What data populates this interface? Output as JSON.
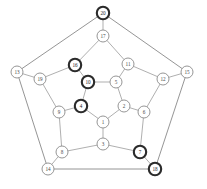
{
  "figure": {
    "type": "graph-diagram",
    "name": "dodecahedral-graph",
    "background_color": "#ffffff",
    "edge_color": "#8d8d8d",
    "node_fill": "#ffffff",
    "node_stroke": "#8a8a8a",
    "highlight_stroke": "#2b2b2b",
    "label_color": "#4a4a4a"
  },
  "chart_data": {
    "type": "graph",
    "title": "",
    "node_count": 20,
    "edge_count": 30,
    "nodes": [
      {
        "id": "1",
        "label": "1",
        "x": 103,
        "y": 122,
        "r": 6.0,
        "highlighted": false
      },
      {
        "id": "2",
        "label": "2",
        "x": 124,
        "y": 106,
        "r": 6.0,
        "highlighted": false
      },
      {
        "id": "3",
        "label": "3",
        "x": 103,
        "y": 144,
        "r": 6.0,
        "highlighted": false
      },
      {
        "id": "4",
        "label": "4",
        "x": 81,
        "y": 106,
        "r": 6.2,
        "highlighted": true
      },
      {
        "id": "5",
        "label": "5",
        "x": 116,
        "y": 82,
        "r": 6.0,
        "highlighted": false
      },
      {
        "id": "6",
        "label": "6",
        "x": 144,
        "y": 112,
        "r": 6.0,
        "highlighted": false
      },
      {
        "id": "7",
        "label": "7",
        "x": 140,
        "y": 152,
        "r": 6.2,
        "highlighted": true
      },
      {
        "id": "8",
        "label": "8",
        "x": 62,
        "y": 152,
        "r": 6.0,
        "highlighted": false
      },
      {
        "id": "9",
        "label": "9",
        "x": 59,
        "y": 112,
        "r": 6.0,
        "highlighted": false
      },
      {
        "id": "10",
        "label": "10",
        "x": 88,
        "y": 82,
        "r": 6.2,
        "highlighted": true
      },
      {
        "id": "11",
        "label": "11",
        "x": 128,
        "y": 64,
        "r": 6.0,
        "highlighted": false
      },
      {
        "id": "12",
        "label": "12",
        "x": 163,
        "y": 79,
        "r": 6.0,
        "highlighted": false
      },
      {
        "id": "13",
        "label": "13",
        "x": 17,
        "y": 72,
        "r": 6.0,
        "highlighted": false
      },
      {
        "id": "14",
        "label": "14",
        "x": 48,
        "y": 169,
        "r": 6.0,
        "highlighted": false
      },
      {
        "id": "15",
        "label": "15",
        "x": 187,
        "y": 72,
        "r": 6.0,
        "highlighted": false
      },
      {
        "id": "16",
        "label": "16",
        "x": 75,
        "y": 65,
        "r": 6.2,
        "highlighted": true
      },
      {
        "id": "17",
        "label": "17",
        "x": 103,
        "y": 36,
        "r": 6.0,
        "highlighted": false
      },
      {
        "id": "18",
        "label": "18",
        "x": 155,
        "y": 169,
        "r": 6.2,
        "highlighted": true
      },
      {
        "id": "19",
        "label": "19",
        "x": 40,
        "y": 79,
        "r": 6.0,
        "highlighted": false
      },
      {
        "id": "20",
        "label": "20",
        "x": 103,
        "y": 13,
        "r": 6.2,
        "highlighted": true
      }
    ],
    "edges": [
      {
        "source": "1",
        "target": "2",
        "ring": "inner"
      },
      {
        "source": "1",
        "target": "4",
        "ring": "inner"
      },
      {
        "source": "1",
        "target": "3",
        "ring": "spoke"
      },
      {
        "source": "2",
        "target": "5",
        "ring": "inner"
      },
      {
        "source": "2",
        "target": "6",
        "ring": "spoke"
      },
      {
        "source": "4",
        "target": "10",
        "ring": "inner"
      },
      {
        "source": "4",
        "target": "9",
        "ring": "spoke"
      },
      {
        "source": "5",
        "target": "10",
        "ring": "inner"
      },
      {
        "source": "5",
        "target": "11",
        "ring": "spoke"
      },
      {
        "source": "10",
        "target": "16",
        "ring": "spoke"
      },
      {
        "source": "3",
        "target": "8",
        "ring": "middle"
      },
      {
        "source": "3",
        "target": "7",
        "ring": "middle"
      },
      {
        "source": "6",
        "target": "7",
        "ring": "middle"
      },
      {
        "source": "6",
        "target": "12",
        "ring": "middle"
      },
      {
        "source": "11",
        "target": "12",
        "ring": "middle"
      },
      {
        "source": "11",
        "target": "17",
        "ring": "middle"
      },
      {
        "source": "16",
        "target": "17",
        "ring": "middle"
      },
      {
        "source": "16",
        "target": "19",
        "ring": "middle"
      },
      {
        "source": "9",
        "target": "19",
        "ring": "middle"
      },
      {
        "source": "9",
        "target": "8",
        "ring": "middle"
      },
      {
        "source": "17",
        "target": "20",
        "ring": "spoke"
      },
      {
        "source": "12",
        "target": "15",
        "ring": "spoke"
      },
      {
        "source": "7",
        "target": "18",
        "ring": "spoke"
      },
      {
        "source": "8",
        "target": "14",
        "ring": "spoke"
      },
      {
        "source": "19",
        "target": "13",
        "ring": "spoke"
      },
      {
        "source": "20",
        "target": "13",
        "ring": "outer"
      },
      {
        "source": "20",
        "target": "15",
        "ring": "outer"
      },
      {
        "source": "15",
        "target": "18",
        "ring": "outer"
      },
      {
        "source": "18",
        "target": "14",
        "ring": "outer"
      },
      {
        "source": "14",
        "target": "13",
        "ring": "outer"
      }
    ],
    "highlighted_nodes": [
      "4",
      "7",
      "10",
      "16",
      "18",
      "20"
    ]
  }
}
